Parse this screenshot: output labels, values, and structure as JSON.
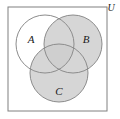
{
  "figure": {
    "type": "venn-diagram",
    "universe": {
      "label": "U",
      "label_x": 111,
      "label_y": 9,
      "rect": {
        "x": 8,
        "y": 7,
        "width": 99,
        "height": 104
      },
      "fill": "#ffffff",
      "stroke": "#808080"
    },
    "shaded_fill": "#d6d6d6",
    "unshaded_fill": "#ffffff",
    "triple_overlap_fill": "#cfcfcf",
    "circle_stroke": "#8c8c8c",
    "sets": [
      {
        "id": "A",
        "label": "A",
        "cx": 45,
        "cy": 44,
        "r": 29,
        "shaded": false,
        "label_x": 31,
        "label_y": 40
      },
      {
        "id": "B",
        "label": "B",
        "cx": 73,
        "cy": 44,
        "r": 29,
        "shaded": true,
        "label_x": 86,
        "label_y": 40
      },
      {
        "id": "C",
        "label": "C",
        "cx": 59,
        "cy": 73,
        "r": 29,
        "shaded": true,
        "label_x": 59,
        "label_y": 92
      }
    ]
  }
}
